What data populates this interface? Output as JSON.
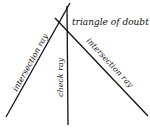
{
  "diagram": {
    "labels": {
      "triangle": "triangle of doubt",
      "left_ray": "intersection ray",
      "check_ray": "check ray",
      "right_ray": "intersection ray"
    },
    "colors": {
      "line": "#111111",
      "background": "#ffffff"
    }
  }
}
